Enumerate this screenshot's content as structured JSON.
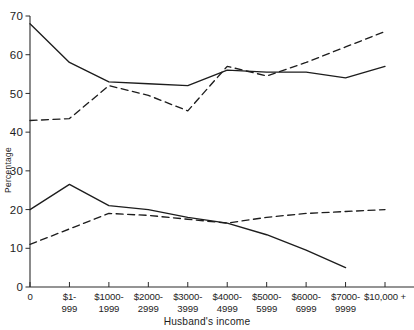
{
  "chart_data": {
    "type": "line",
    "title": "",
    "xlabel": "Husband's income",
    "ylabel": "Percentage",
    "grid": false,
    "legend": "none",
    "ylim": [
      0,
      70
    ],
    "yticks": [
      0,
      10,
      20,
      30,
      40,
      50,
      60,
      70
    ],
    "ytick_labels": [
      "0",
      "10",
      "20",
      "30",
      "40",
      "50",
      "60",
      "70"
    ],
    "categories": [
      "0",
      "$1-\n999",
      "$1000-\n1999",
      "$2000-\n2999",
      "$3000-\n3999",
      "$4000-\n4999",
      "$5000-\n5999",
      "$6000-\n6999",
      "$7000-\n9999",
      "$10,000 +"
    ],
    "xtick_labels_line1": [
      "0",
      "$1-",
      "$1000-",
      "$2000-",
      "$3000-",
      "$4000-",
      "$5000-",
      "$6000-",
      "$7000-",
      "$10,000 +"
    ],
    "xtick_labels_line2": [
      "",
      "999",
      "1999",
      "2999",
      "3999",
      "4999",
      "5999",
      "6999",
      "9999",
      ""
    ],
    "series": [
      {
        "name": "upper-solid",
        "style": "solid",
        "color": "#1d1d1d",
        "values": [
          68,
          58,
          53,
          52.5,
          52,
          56,
          55.5,
          55.5,
          54,
          57
        ]
      },
      {
        "name": "upper-dashed",
        "style": "dashed",
        "color": "#1d1d1d",
        "values": [
          43,
          43.5,
          52,
          49.5,
          45.5,
          57,
          54.5,
          58,
          62,
          66
        ],
        "truncated_right": true
      },
      {
        "name": "lower-solid",
        "style": "solid",
        "color": "#1d1d1d",
        "values": [
          20,
          26.5,
          21,
          20,
          18,
          16.5,
          13.5,
          9.5,
          5,
          null
        ]
      },
      {
        "name": "lower-dashed",
        "style": "dashed",
        "color": "#1d1d1d",
        "values": [
          11,
          15,
          19,
          18.5,
          17.5,
          16.5,
          18,
          19,
          19.5,
          20
        ]
      }
    ]
  }
}
